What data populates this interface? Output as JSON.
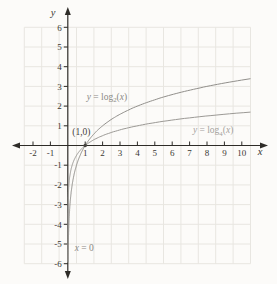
{
  "chart_data": {
    "type": "line",
    "title": "",
    "xlabel": "x",
    "ylabel": "y",
    "xlim": [
      -2,
      10
    ],
    "ylim": [
      -6,
      6
    ],
    "grid": true,
    "x_ticks": [
      -2,
      -1,
      1,
      2,
      3,
      4,
      5,
      6,
      7,
      8,
      9,
      10
    ],
    "y_ticks": [
      -6,
      -5,
      -4,
      -3,
      -2,
      -1,
      1,
      2,
      3,
      4,
      5,
      6
    ],
    "series": [
      {
        "name": "y = log2(x)",
        "base": 2,
        "color": "#918f8b",
        "label_color": "#8b8984",
        "label_pos": {
          "x": 2.25,
          "y": 2.5
        },
        "label_parts": [
          {
            "t": "y",
            "i": true
          },
          {
            "t": " = log"
          },
          {
            "t": "2",
            "sub": true
          },
          {
            "t": "("
          },
          {
            "t": "x",
            "i": true
          },
          {
            "t": ")"
          }
        ],
        "key_points": [
          [
            0.125,
            -3
          ],
          [
            0.25,
            -2
          ],
          [
            0.5,
            -1
          ],
          [
            1,
            0
          ],
          [
            2,
            1
          ],
          [
            4,
            2
          ],
          [
            8,
            3
          ],
          [
            10,
            3.32
          ]
        ]
      },
      {
        "name": "y = log4(x)",
        "base": 4,
        "color": "#9b9995",
        "label_color": "#a5a29d",
        "label_pos": {
          "x": 8.35,
          "y": 0.78
        },
        "label_parts": [
          {
            "t": "y",
            "i": true
          },
          {
            "t": " = log"
          },
          {
            "t": "4",
            "sub": true
          },
          {
            "t": "("
          },
          {
            "t": "x",
            "i": true
          },
          {
            "t": ")"
          }
        ],
        "key_points": [
          [
            0.0625,
            -2
          ],
          [
            0.25,
            -1
          ],
          [
            0.5,
            -0.5
          ],
          [
            1,
            0
          ],
          [
            2,
            0.5
          ],
          [
            4,
            1
          ],
          [
            8,
            1.5
          ],
          [
            10,
            1.66
          ]
        ]
      }
    ],
    "marked_point": {
      "x": 1,
      "y": 0,
      "label": "(1,0)",
      "label_pos": {
        "x": 0.78,
        "y": 0.68
      },
      "color": "#474440",
      "label_color": "#45423e"
    },
    "asymptote": {
      "label_parts": [
        {
          "t": "x",
          "i": true
        },
        {
          "t": " = 0"
        }
      ],
      "label_pos": {
        "x": 0.95,
        "y": -5.2
      },
      "label_color": "#8b8984"
    },
    "colors": {
      "background": "#fcfbf9",
      "grid": "#e8e6e1",
      "axis": "#2e2c28",
      "tick_label": "#3a3833"
    }
  }
}
